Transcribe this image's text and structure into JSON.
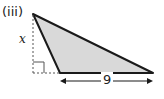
{
  "figure": {
    "part_label": "(iii)",
    "height_label": "x",
    "base_label": "9",
    "colors": {
      "fill": "#d9d9d9",
      "stroke": "#1a1a1a",
      "dashed": "#555555"
    }
  }
}
